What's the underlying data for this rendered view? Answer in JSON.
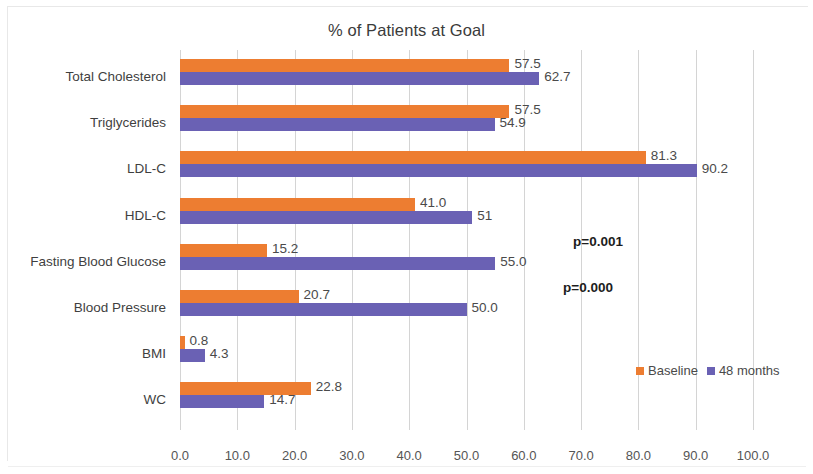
{
  "chart_data": {
    "type": "bar",
    "orientation": "horizontal",
    "title": "% of Patients at Goal",
    "xlabel": "",
    "ylabel": "",
    "xlim": [
      0,
      100
    ],
    "xticks": [
      "0.0",
      "10.0",
      "20.0",
      "30.0",
      "40.0",
      "50.0",
      "60.0",
      "70.0",
      "80.0",
      "90.0",
      "100.0"
    ],
    "grid": true,
    "legend_position": "right-middle",
    "categories": [
      "Total Cholesterol",
      "Triglycerides",
      "LDL-C",
      "HDL-C",
      "Fasting Blood Glucose",
      "Blood Pressure",
      "BMI",
      "WC"
    ],
    "series": [
      {
        "name": "Baseline",
        "color": "#ED7D31",
        "values": [
          57.5,
          57.5,
          81.3,
          41.0,
          15.2,
          20.7,
          0.8,
          22.8
        ],
        "labels": [
          "57.5",
          "57.5",
          "81.3",
          "41.0",
          "15.2",
          "20.7",
          "0.8",
          "22.8"
        ]
      },
      {
        "name": "48 months",
        "color": "#6A61B4",
        "values": [
          62.7,
          54.9,
          90.2,
          51.0,
          55.0,
          50.0,
          4.3,
          14.7
        ],
        "labels": [
          "62.7",
          "54.9",
          "90.2",
          "51",
          "55.0",
          "50.0",
          "4.3",
          "14.7"
        ]
      }
    ],
    "annotations": [
      {
        "text": "p=0.001",
        "category": "Fasting Blood Glucose"
      },
      {
        "text": "p=0.000",
        "category": "Blood Pressure"
      }
    ]
  }
}
